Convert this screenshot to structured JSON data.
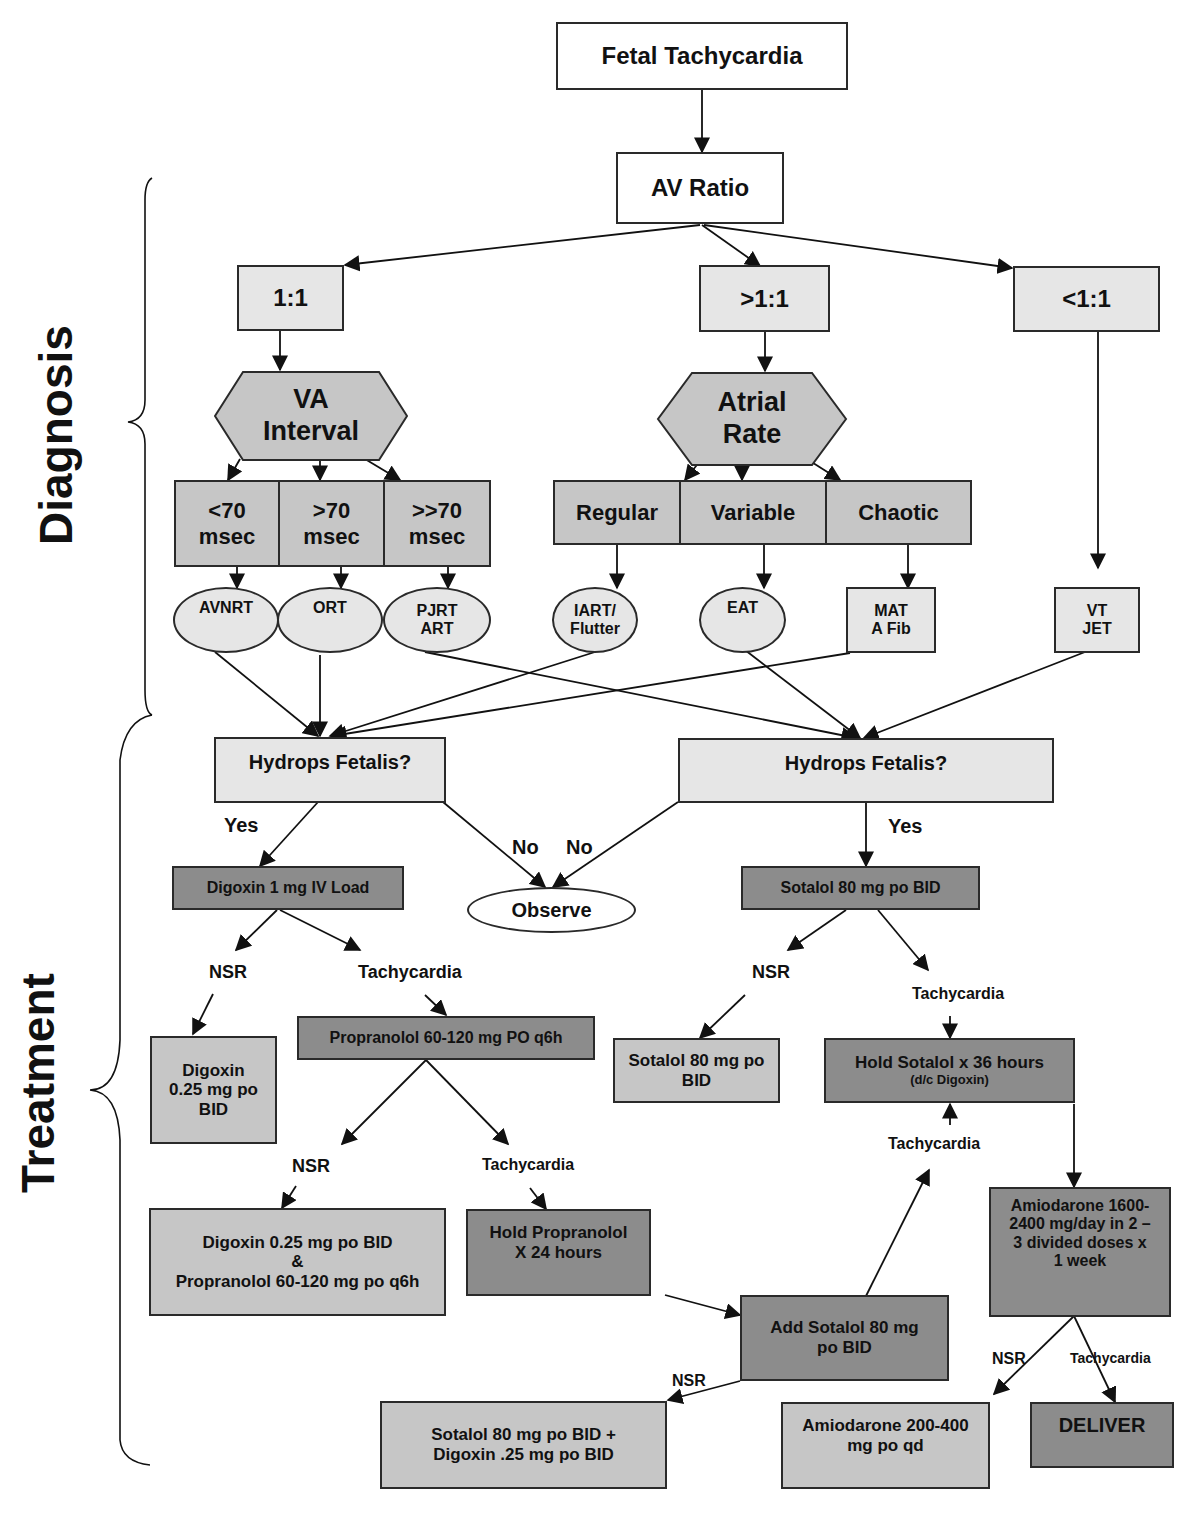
{
  "sections": {
    "diagnosis": "Diagnosis",
    "treatment": "Treatment"
  },
  "diagnosis": {
    "root": "Fetal Tachycardia",
    "av_ratio": "AV Ratio",
    "ratios": [
      "1:1",
      ">1:1",
      "<1:1"
    ],
    "va_interval": "VA\nInterval",
    "atrial_rate": "Atrial\nRate",
    "va_categories": [
      "<70\nmsec",
      ">70\nmsec",
      ">>70\nmsec"
    ],
    "atrial_categories": [
      "Regular",
      "Variable",
      "Chaotic"
    ],
    "rhythms": {
      "avnrt": "AVNRT",
      "ort": "ORT",
      "pjrt": "PJRT\nART",
      "iart": "IART/\nFlutter",
      "eat": "EAT",
      "mat": "MAT\nA Fib",
      "vt": "VT\nJET"
    }
  },
  "treatment": {
    "hydrops_left": "Hydrops Fetalis?",
    "hydrops_right": "Hydrops Fetalis?",
    "yes_left": "Yes",
    "yes_right": "Yes",
    "no_left": "No",
    "no_right": "No",
    "observe": "Observe",
    "digoxin_load": "Digoxin 1 mg IV Load",
    "sotalol_start": "Sotalol 80 mg po BID",
    "nsr_1": "NSR",
    "tachy_1": "Tachycardia",
    "digoxin_maint": "Digoxin\n0.25 mg po\nBID",
    "propranolol": "Propranolol 60-120 mg PO q6h",
    "nsr_2": "NSR",
    "tachy_2": "Tachycardia",
    "dig_prop": "Digoxin 0.25 mg po BID\n&\nPropranolol 60-120 mg po q6h",
    "hold_prop": "Hold Propranolol\nX 24 hours",
    "add_sotalol": "Add Sotalol 80 mg\npo BID",
    "nsr_3": "NSR",
    "sot_dig": "Sotalol 80 mg po BID +\nDigoxin .25 mg po BID",
    "nsr_4": "NSR",
    "tachy_4": "Tachycardia",
    "sotalol_maint": "Sotalol 80 mg po\nBID",
    "hold_sotalol": "Hold Sotalol x 36 hours",
    "hold_sotalol_note": "(d/c Digoxin)",
    "tachy_5": "Tachycardia",
    "amio_load": "Amiodarone 1600-\n2400 mg/day in 2 –\n3 divided doses x\n1 week",
    "nsr_6": "NSR",
    "tachy_6": "Tachycardia",
    "amio_maint": "Amiodarone 200-400\nmg po qd",
    "deliver": "DELIVER"
  },
  "colors": {
    "light_fill": "#e6e6e6",
    "mid_fill": "#c6c6c6",
    "dark_fill": "#8c8c8c",
    "stroke": "#2a2a2a"
  }
}
